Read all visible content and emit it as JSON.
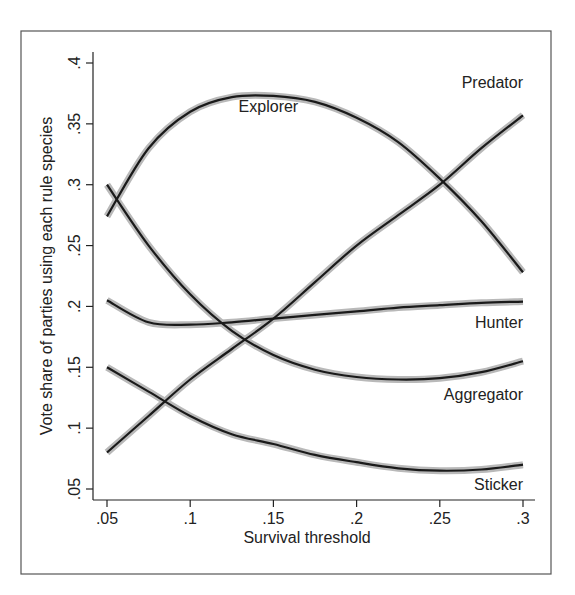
{
  "chart_data": {
    "type": "line",
    "title": "",
    "xlabel": "Survival threshold",
    "ylabel": "Vote share of parties using each rule species",
    "xlim": [
      0.05,
      0.3
    ],
    "ylim": [
      0.05,
      0.4
    ],
    "grid": false,
    "legend_position": "inline labels",
    "x_ticks": [
      ".05",
      ".1",
      ".15",
      ".2",
      ".25",
      ".3"
    ],
    "y_ticks": [
      ".05",
      ".1",
      ".15",
      ".2",
      ".25",
      ".3",
      ".35",
      ".4"
    ],
    "x": [
      0.05,
      0.075,
      0.1,
      0.125,
      0.15,
      0.175,
      0.2,
      0.225,
      0.25,
      0.275,
      0.3
    ],
    "series": [
      {
        "name": "Explorer",
        "values": [
          0.274,
          0.33,
          0.36,
          0.372,
          0.373,
          0.368,
          0.355,
          0.335,
          0.305,
          0.27,
          0.228
        ]
      },
      {
        "name": "Predator",
        "values": [
          0.08,
          0.11,
          0.14,
          0.165,
          0.19,
          0.22,
          0.25,
          0.275,
          0.3,
          0.33,
          0.357
        ]
      },
      {
        "name": "Hunter",
        "values": [
          0.205,
          0.187,
          0.185,
          0.187,
          0.19,
          0.193,
          0.196,
          0.199,
          0.201,
          0.203,
          0.204
        ]
      },
      {
        "name": "Aggregator",
        "values": [
          0.3,
          0.25,
          0.21,
          0.18,
          0.16,
          0.148,
          0.142,
          0.14,
          0.141,
          0.146,
          0.155
        ]
      },
      {
        "name": "Sticker",
        "values": [
          0.15,
          0.13,
          0.11,
          0.095,
          0.087,
          0.078,
          0.072,
          0.067,
          0.065,
          0.066,
          0.07
        ]
      }
    ],
    "annotations": [
      {
        "text": "Explorer",
        "x": 0.147,
        "y": 0.365,
        "anchor": "middle"
      },
      {
        "text": "Predator",
        "x": 0.3,
        "y": 0.384,
        "anchor": "end"
      },
      {
        "text": "Hunter",
        "x": 0.3,
        "y": 0.187,
        "anchor": "end"
      },
      {
        "text": "Aggregator",
        "x": 0.3,
        "y": 0.128,
        "anchor": "end"
      },
      {
        "text": "Sticker",
        "x": 0.3,
        "y": 0.054,
        "anchor": "end"
      }
    ],
    "confidence_band": true,
    "colors": {
      "line": "#1a1a1a",
      "band": "#b9b9b9",
      "frame": "#555555"
    }
  }
}
